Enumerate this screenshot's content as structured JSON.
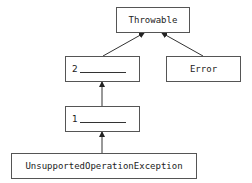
{
  "diagram": {
    "nodes": {
      "throwable": {
        "label": "Throwable"
      },
      "blank2": {
        "label": "2"
      },
      "error": {
        "label": "Error"
      },
      "blank1": {
        "label": "1"
      },
      "unsupported": {
        "label": "UnsupportedOperationException"
      }
    },
    "edges": [
      {
        "from": "blank2",
        "to": "throwable"
      },
      {
        "from": "error",
        "to": "throwable"
      },
      {
        "from": "blank1",
        "to": "blank2"
      },
      {
        "from": "unsupported",
        "to": "blank1"
      }
    ]
  }
}
